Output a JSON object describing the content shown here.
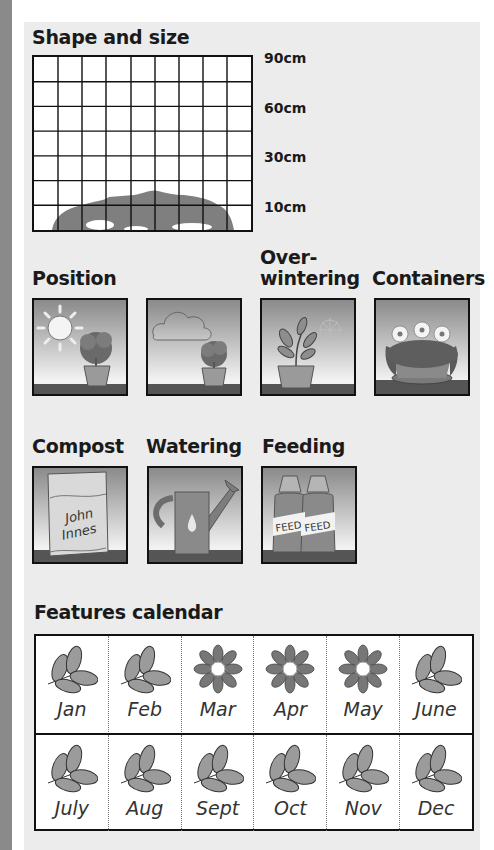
{
  "shape_and_size": {
    "title": "Shape and size",
    "grid": {
      "columns": 9,
      "rows": 7
    },
    "height_labels": [
      "90cm",
      "60cm",
      "30cm",
      "10cm"
    ],
    "plant_silhouette_height_cm": 10
  },
  "position": {
    "title": "Position",
    "icons": [
      "full-sun-icon",
      "partial-shade-icon"
    ]
  },
  "overwintering": {
    "title_line1": "Over-",
    "title_line2": "wintering",
    "icon": "frost-protect-icon"
  },
  "containers": {
    "title": "Containers",
    "icon": "container-plant-icon"
  },
  "compost": {
    "title": "Compost",
    "bag_line1": "John",
    "bag_line2": "Innes"
  },
  "watering": {
    "title": "Watering",
    "icon": "watering-can-icon"
  },
  "feeding": {
    "title": "Feeding",
    "label": "FEED"
  },
  "features_calendar": {
    "title": "Features calendar",
    "months": [
      {
        "name": "Jan",
        "feature": "foliage"
      },
      {
        "name": "Feb",
        "feature": "foliage"
      },
      {
        "name": "Mar",
        "feature": "flower"
      },
      {
        "name": "Apr",
        "feature": "flower"
      },
      {
        "name": "May",
        "feature": "flower"
      },
      {
        "name": "June",
        "feature": "foliage"
      },
      {
        "name": "July",
        "feature": "foliage"
      },
      {
        "name": "Aug",
        "feature": "foliage"
      },
      {
        "name": "Sept",
        "feature": "foliage"
      },
      {
        "name": "Oct",
        "feature": "foliage"
      },
      {
        "name": "Nov",
        "feature": "foliage"
      },
      {
        "name": "Dec",
        "feature": "foliage"
      }
    ]
  },
  "colors": {
    "panel": "#ececec",
    "plant_silhouette": "#7f7f7f",
    "icon_green": "#8d8d8d",
    "border": "#111111"
  }
}
